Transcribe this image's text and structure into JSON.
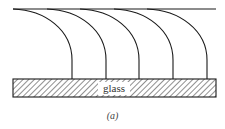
{
  "figure": {
    "substrate_label": "glass",
    "caption": "(a)",
    "line_color": "#1a1a1a",
    "top_line": {
      "x1": 13,
      "x2": 216,
      "y": 9
    },
    "glass": {
      "x": 13,
      "y": 79,
      "width": 203,
      "height": 18
    },
    "arcs": [
      {
        "start_x": 13,
        "end_x": 72
      },
      {
        "start_x": 47,
        "end_x": 106
      },
      {
        "start_x": 80,
        "end_x": 139
      },
      {
        "start_x": 114,
        "end_x": 173
      },
      {
        "start_x": 147,
        "end_x": 207
      }
    ]
  }
}
